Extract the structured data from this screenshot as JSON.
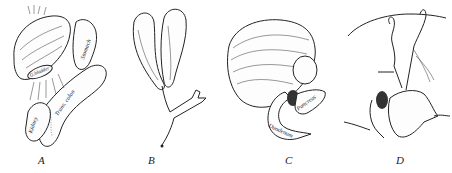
{
  "figure": {
    "panels": [
      {
        "id": "A",
        "letter": "A",
        "labels": {
          "stomach": "Stomach",
          "trans_colon": "Trans. colon",
          "kidney": "Kidney",
          "gallbladder": "G.bladder"
        }
      },
      {
        "id": "B",
        "letter": "B",
        "labels": {}
      },
      {
        "id": "C",
        "letter": "C",
        "labels": {
          "pancreas": "Pancreas",
          "duodenum": "Duodenum"
        }
      },
      {
        "id": "D",
        "letter": "D",
        "labels": {}
      }
    ]
  }
}
